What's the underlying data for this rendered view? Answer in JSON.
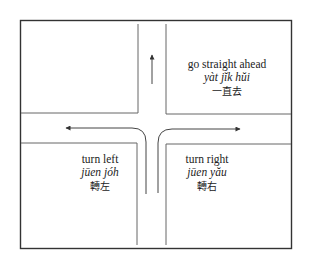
{
  "diagram": {
    "title": "",
    "colors": {
      "line": "#555555",
      "frame": "#333333",
      "arrow": "#444444"
    },
    "directions": [
      {
        "id": "straight",
        "english": "go straight ahead",
        "romanization": "yàt jĭk hŭi",
        "chinese": "一直去"
      },
      {
        "id": "left",
        "english": "turn left",
        "romanization": "jūen jóh",
        "chinese": "轉左"
      },
      {
        "id": "right",
        "english": "turn right",
        "romanization": "jūen yău",
        "chinese": "轉右"
      }
    ]
  }
}
